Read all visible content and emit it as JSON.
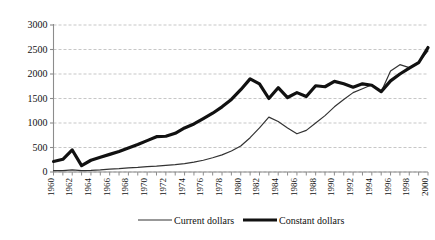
{
  "chart_data": {
    "type": "line",
    "title": "",
    "subtitle": "",
    "xlabel": "",
    "ylabel": "",
    "xlim": [
      1960,
      2000
    ],
    "ylim": [
      0,
      3000
    ],
    "yticks": [
      0,
      500,
      1000,
      1500,
      2000,
      2500,
      3000
    ],
    "ytick_labels": [
      "0",
      "500",
      "1000",
      "1500",
      "2000",
      "2500",
      "3000"
    ],
    "x": [
      1960,
      1961,
      1962,
      1963,
      1964,
      1965,
      1966,
      1967,
      1968,
      1969,
      1970,
      1971,
      1972,
      1973,
      1974,
      1975,
      1976,
      1977,
      1978,
      1979,
      1980,
      1981,
      1982,
      1983,
      1984,
      1985,
      1986,
      1987,
      1988,
      1989,
      1990,
      1991,
      1992,
      1993,
      1994,
      1995,
      1996,
      1997,
      1998,
      1999,
      2000
    ],
    "xtick_labels": [
      "1960",
      "1962",
      "1964",
      "1966",
      "1968",
      "1970",
      "1972",
      "1974",
      "1976",
      "1978",
      "1980",
      "1982",
      "1984",
      "1986",
      "1988",
      "1990",
      "1992",
      "1994",
      "1996",
      "1998",
      "2000"
    ],
    "xtick_step": 2,
    "minor_ticks_every": 1,
    "grid": true,
    "grid_axis": "y",
    "grid_style": "dashed",
    "grid_color": "#b9b9b9",
    "axis_color": "#8c8c8c",
    "legend_position": "bottom",
    "series": [
      {
        "name": "Current dollars",
        "color": "#333333",
        "width": 1.2,
        "values": [
          30,
          30,
          45,
          30,
          35,
          45,
          60,
          70,
          85,
          95,
          110,
          120,
          135,
          150,
          170,
          200,
          240,
          290,
          350,
          430,
          530,
          700,
          900,
          1120,
          1030,
          900,
          780,
          850,
          1000,
          1150,
          1330,
          1480,
          1620,
          1700,
          1780,
          1640,
          2060,
          2190,
          2130,
          2240,
          2470
        ]
      },
      {
        "name": "Constant dollars",
        "color": "#111111",
        "width": 3.2,
        "values": [
          215,
          260,
          450,
          130,
          240,
          300,
          360,
          420,
          490,
          560,
          640,
          720,
          730,
          790,
          900,
          980,
          1090,
          1200,
          1330,
          1480,
          1680,
          1900,
          1800,
          1500,
          1720,
          1520,
          1620,
          1540,
          1760,
          1740,
          1850,
          1800,
          1730,
          1800,
          1770,
          1640,
          1860,
          2000,
          2120,
          2230,
          2540
        ]
      }
    ]
  },
  "legend": {
    "items": [
      {
        "label": "Current dollars"
      },
      {
        "label": "Constant dollars"
      }
    ]
  }
}
